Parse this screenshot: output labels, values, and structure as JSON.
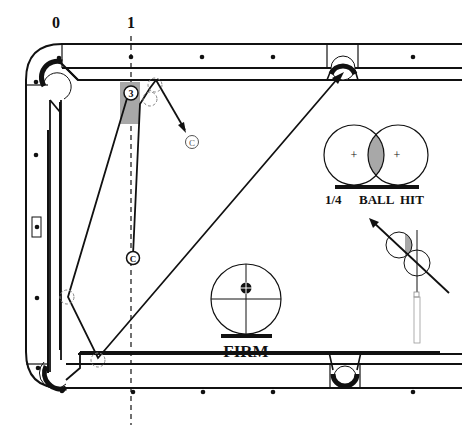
{
  "diagram": {
    "title_partial": "",
    "diamond_labels": [
      "0",
      "1"
    ],
    "object_ball_label": "3",
    "cue_ball_label": "C",
    "cue_ball_final_label": "C",
    "ball_hit": {
      "fraction": "1/4",
      "text_ball": "BALL",
      "text_hit": "HIT"
    },
    "speed": {
      "label": "FIRM"
    },
    "colors": {
      "line": "#111111",
      "shade": "#a8a8a8",
      "ghost": "#888888"
    }
  }
}
